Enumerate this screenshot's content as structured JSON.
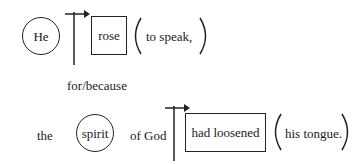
{
  "diagram": {
    "clause1": {
      "subject": "He",
      "verb": "rose",
      "complement": "to speak,"
    },
    "connector": "for/because",
    "clause2": {
      "article": "the",
      "subject": "spirit",
      "modifier": "of God",
      "verb": "had loosened",
      "object": "his tongue."
    }
  }
}
